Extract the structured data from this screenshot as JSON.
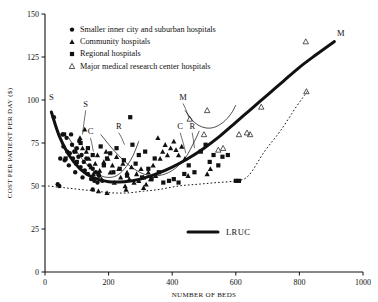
{
  "chart_data": {
    "type": "scatter",
    "title": "",
    "xlabel": "NUMBER OF BEDS",
    "ylabel": "COST PER PATIENT PER DAY ($)",
    "xlim": [
      0,
      1000
    ],
    "ylim": [
      0,
      150
    ],
    "xticks": [
      0,
      200,
      400,
      600,
      800,
      1000
    ],
    "yticks": [
      0,
      25,
      50,
      75,
      100,
      125,
      150
    ],
    "grid": false,
    "legend_position": "top-left",
    "legend": [
      {
        "marker": "filled-circle",
        "label": "Smaller inner city and suburban hospitals"
      },
      {
        "marker": "filled-triangle",
        "label": "Community hospitals"
      },
      {
        "marker": "filled-square",
        "label": "Regional hospitals"
      },
      {
        "marker": "open-triangle",
        "label": "Major medical research center hospitals"
      }
    ],
    "secondary_legend": {
      "label": "LRUC",
      "marker": "thick-line"
    },
    "annotations": [
      {
        "text": "S",
        "x": 20,
        "y": 100
      },
      {
        "text": "S",
        "x": 128,
        "y": 96
      },
      {
        "text": "C",
        "x": 143,
        "y": 80
      },
      {
        "text": "R",
        "x": 232,
        "y": 83
      },
      {
        "text": "M",
        "x": 434,
        "y": 100
      },
      {
        "text": "C",
        "x": 425,
        "y": 83
      },
      {
        "text": "R",
        "x": 463,
        "y": 83
      },
      {
        "text": "M",
        "x": 930,
        "y": 137
      }
    ],
    "series": [
      {
        "name": "Smaller inner city and suburban hospitals",
        "marker": "filled-circle",
        "points": [
          [
            28,
            90
          ],
          [
            40,
            51
          ],
          [
            45,
            50
          ],
          [
            48,
            66
          ],
          [
            55,
            80
          ],
          [
            58,
            73
          ],
          [
            62,
            65
          ],
          [
            68,
            78
          ],
          [
            70,
            70
          ],
          [
            75,
            62
          ],
          [
            78,
            69
          ],
          [
            82,
            80
          ],
          [
            85,
            74
          ],
          [
            88,
            66
          ],
          [
            92,
            70
          ],
          [
            95,
            58
          ],
          [
            98,
            63
          ],
          [
            100,
            72
          ],
          [
            105,
            67
          ],
          [
            108,
            76
          ],
          [
            112,
            61
          ],
          [
            115,
            68
          ],
          [
            118,
            55
          ],
          [
            122,
            64
          ],
          [
            125,
            59
          ],
          [
            130,
            66
          ],
          [
            135,
            57
          ],
          [
            140,
            62
          ],
          [
            145,
            54
          ],
          [
            150,
            60
          ],
          [
            155,
            53
          ],
          [
            160,
            58
          ],
          [
            165,
            52
          ],
          [
            170,
            56
          ],
          [
            150,
            48
          ],
          [
            180,
            53
          ]
        ]
      },
      {
        "name": "Community hospitals",
        "marker": "filled-triangle",
        "points": [
          [
            110,
            78
          ],
          [
            118,
            72
          ],
          [
            125,
            83
          ],
          [
            130,
            70
          ],
          [
            138,
            66
          ],
          [
            145,
            61
          ],
          [
            152,
            57
          ],
          [
            158,
            63
          ],
          [
            165,
            68
          ],
          [
            172,
            59
          ],
          [
            178,
            54
          ],
          [
            185,
            64
          ],
          [
            192,
            70
          ],
          [
            198,
            66
          ],
          [
            205,
            58
          ],
          [
            212,
            62
          ],
          [
            218,
            52
          ],
          [
            225,
            67
          ],
          [
            232,
            60
          ],
          [
            238,
            55
          ],
          [
            245,
            63
          ],
          [
            252,
            50
          ],
          [
            258,
            58
          ],
          [
            265,
            54
          ],
          [
            272,
            61
          ],
          [
            280,
            52
          ],
          [
            288,
            57
          ],
          [
            295,
            53
          ],
          [
            302,
            60
          ],
          [
            310,
            55
          ],
          [
            318,
            51
          ],
          [
            325,
            58
          ],
          [
            332,
            54
          ],
          [
            340,
            62
          ],
          [
            348,
            56
          ],
          [
            355,
            78
          ],
          [
            362,
            66
          ],
          [
            370,
            70
          ],
          [
            378,
            74
          ],
          [
            385,
            68
          ],
          [
            395,
            72
          ],
          [
            405,
            76
          ],
          [
            412,
            71
          ],
          [
            420,
            68
          ],
          [
            430,
            73
          ],
          [
            440,
            66
          ],
          [
            450,
            56
          ],
          [
            510,
            57
          ],
          [
            520,
            60
          ],
          [
            168,
            47
          ],
          [
            195,
            46
          ],
          [
            255,
            48
          ],
          [
            310,
            49
          ]
        ]
      },
      {
        "name": "Regional hospitals",
        "marker": "filled-square",
        "points": [
          [
            60,
            80
          ],
          [
            65,
            66
          ],
          [
            95,
            70
          ],
          [
            100,
            64
          ],
          [
            112,
            75
          ],
          [
            135,
            72
          ],
          [
            150,
            68
          ],
          [
            168,
            57
          ],
          [
            175,
            73
          ],
          [
            185,
            62
          ],
          [
            195,
            66
          ],
          [
            205,
            69
          ],
          [
            215,
            58
          ],
          [
            225,
            72
          ],
          [
            235,
            60
          ],
          [
            248,
            65
          ],
          [
            258,
            56
          ],
          [
            268,
            90
          ],
          [
            275,
            74
          ],
          [
            285,
            63
          ],
          [
            295,
            68
          ],
          [
            305,
            55
          ],
          [
            315,
            70
          ],
          [
            325,
            60
          ],
          [
            335,
            54
          ],
          [
            345,
            66
          ],
          [
            358,
            58
          ],
          [
            372,
            52
          ],
          [
            390,
            53
          ],
          [
            405,
            54
          ],
          [
            420,
            52
          ],
          [
            438,
            57
          ],
          [
            452,
            62
          ],
          [
            470,
            58
          ],
          [
            490,
            70
          ],
          [
            505,
            74
          ],
          [
            518,
            64
          ],
          [
            530,
            68
          ],
          [
            545,
            62
          ],
          [
            558,
            67
          ],
          [
            575,
            68
          ],
          [
            600,
            53
          ],
          [
            610,
            53
          ]
        ]
      },
      {
        "name": "Major medical research center hospitals",
        "marker": "open-triangle",
        "points": [
          [
            455,
            89
          ],
          [
            500,
            80
          ],
          [
            510,
            94
          ],
          [
            545,
            71
          ],
          [
            560,
            72
          ],
          [
            610,
            80
          ],
          [
            635,
            81
          ],
          [
            645,
            80
          ],
          [
            680,
            96
          ],
          [
            820,
            134
          ],
          [
            822,
            105
          ]
        ]
      }
    ],
    "curves": [
      {
        "name": "LRUC",
        "style": "thick-solid",
        "label": "LRUC",
        "description": "Long run unit cost envelope curve",
        "points": [
          [
            20,
            93
          ],
          [
            45,
            79
          ],
          [
            75,
            68
          ],
          [
            110,
            60
          ],
          [
            150,
            55
          ],
          [
            200,
            52.5
          ],
          [
            250,
            52.5
          ],
          [
            300,
            54
          ],
          [
            350,
            57
          ],
          [
            400,
            61
          ],
          [
            450,
            66
          ],
          [
            500,
            72
          ],
          [
            550,
            79
          ],
          [
            600,
            87
          ],
          [
            650,
            95
          ],
          [
            700,
            103
          ],
          [
            750,
            111
          ],
          [
            800,
            119
          ],
          [
            850,
            126
          ],
          [
            910,
            134
          ]
        ]
      },
      {
        "name": "S-curve",
        "style": "thin-solid",
        "description": "Short run cost curve for smaller inner city and suburban hospitals",
        "points": [
          [
            75,
            78
          ],
          [
            100,
            70
          ],
          [
            125,
            64
          ],
          [
            150,
            59
          ],
          [
            175,
            56
          ],
          [
            200,
            55
          ],
          [
            225,
            56
          ],
          [
            250,
            60
          ],
          [
            275,
            67
          ],
          [
            295,
            76
          ]
        ]
      },
      {
        "name": "R-curve",
        "style": "thin-solid",
        "description": "Short run cost curve for regional hospitals",
        "points": [
          [
            175,
            80
          ],
          [
            220,
            70
          ],
          [
            265,
            62
          ],
          [
            310,
            57
          ],
          [
            355,
            56
          ],
          [
            400,
            59
          ],
          [
            440,
            66
          ],
          [
            470,
            76
          ],
          [
            485,
            82
          ]
        ]
      },
      {
        "name": "M-curve",
        "style": "thin-solid",
        "description": "Short run cost curve for major medical research center hospitals",
        "points": [
          [
            440,
            94
          ],
          [
            470,
            87
          ],
          [
            500,
            84
          ],
          [
            530,
            84
          ],
          [
            560,
            87
          ],
          [
            585,
            92
          ],
          [
            600,
            97
          ]
        ]
      },
      {
        "name": "lower-envelope",
        "style": "dotted",
        "description": "Dotted lower boundary of observations",
        "points": [
          [
            10,
            50
          ],
          [
            60,
            49
          ],
          [
            110,
            48
          ],
          [
            160,
            47
          ],
          [
            210,
            46
          ],
          [
            260,
            46
          ],
          [
            310,
            47
          ],
          [
            360,
            48
          ],
          [
            420,
            50
          ],
          [
            480,
            51
          ],
          [
            540,
            52
          ],
          [
            600,
            53
          ],
          [
            640,
            56
          ],
          [
            690,
            70
          ],
          [
            740,
            82
          ],
          [
            790,
            96
          ],
          [
            825,
            105
          ]
        ]
      }
    ]
  }
}
